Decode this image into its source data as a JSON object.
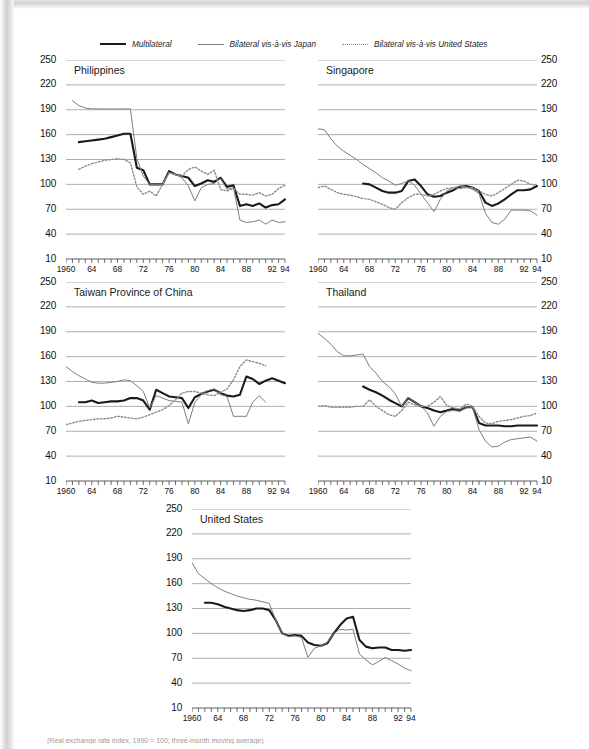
{
  "figure": {
    "footnote": "(Real exchange rate index, 1990 = 100; three-month moving average)"
  },
  "legend": {
    "position": "top",
    "items": [
      {
        "label": "Multilateral",
        "style": "solid-black",
        "color": "#1a1a1a",
        "icon": "line-solid-thick-icon"
      },
      {
        "label": "Bilateral vis-à-vis Japan",
        "style": "solid-gray",
        "color": "#7d7d7d",
        "icon": "line-solid-thin-icon"
      },
      {
        "label": "Bilateral vis-à-vis United States",
        "style": "dotted-gray",
        "color": "#8c8c8c",
        "icon": "line-dotted-icon"
      }
    ]
  },
  "axes": {
    "ylabels": [
      "250",
      "220",
      "190",
      "160",
      "130",
      "100",
      "70",
      "40",
      "10"
    ],
    "yvalues": [
      250,
      220,
      190,
      160,
      130,
      100,
      70,
      40,
      10
    ],
    "ylim": [
      10,
      250
    ],
    "xlabels": [
      "1960",
      "64",
      "68",
      "72",
      "76",
      "80",
      "84",
      "88",
      "92",
      "94"
    ],
    "xvalues": [
      1960,
      1964,
      1968,
      1972,
      1976,
      1980,
      1984,
      1988,
      1992,
      1994
    ],
    "xlim": [
      1960,
      1994
    ],
    "xtick_every": 1,
    "grid": true
  },
  "chart_data": [
    {
      "type": "line",
      "title": "Philippines",
      "xlabel": "",
      "ylabel": "",
      "ylim": [
        10,
        250
      ],
      "xlim": [
        1960,
        1994
      ],
      "grid": true,
      "legend_position": "top",
      "x": [
        1960,
        1961,
        1962,
        1963,
        1964,
        1965,
        1966,
        1967,
        1968,
        1969,
        1970,
        1971,
        1972,
        1973,
        1974,
        1975,
        1976,
        1977,
        1978,
        1979,
        1980,
        1981,
        1982,
        1983,
        1984,
        1985,
        1986,
        1987,
        1988,
        1989,
        1990,
        1991,
        1992,
        1993,
        1994
      ],
      "series": [
        {
          "name": "Multilateral",
          "color": "#1a1a1a",
          "style": "solid-thick",
          "values": [
            null,
            null,
            151,
            152,
            153,
            154,
            155,
            157,
            159,
            161,
            161,
            120,
            117,
            100,
            100,
            100,
            116,
            112,
            110,
            108,
            98,
            101,
            105,
            103,
            108,
            97,
            99,
            74,
            76,
            74,
            77,
            72,
            75,
            76,
            82
          ]
        },
        {
          "name": "Bilateral vis-à-vis Japan",
          "color": "#7d7d7d",
          "style": "solid-thin",
          "values": [
            null,
            201,
            195,
            192,
            191,
            191,
            191,
            191,
            191,
            191,
            191,
            131,
            110,
            100,
            100,
            100,
            114,
            112,
            108,
            98,
            80,
            96,
            100,
            101,
            107,
            94,
            96,
            57,
            54,
            55,
            57,
            52,
            57,
            54,
            55
          ]
        },
        {
          "name": "Bilateral vis-à-vis United States",
          "color": "#8c8c8c",
          "style": "dotted",
          "values": [
            null,
            null,
            118,
            122,
            125,
            127,
            129,
            130,
            131,
            130,
            126,
            97,
            88,
            92,
            86,
            100,
            114,
            112,
            110,
            118,
            121,
            116,
            112,
            117,
            94,
            92,
            95,
            88,
            88,
            87,
            90,
            86,
            88,
            95,
            99
          ]
        }
      ]
    },
    {
      "type": "line",
      "title": "Singapore",
      "xlabel": "",
      "ylabel": "",
      "ylim": [
        10,
        250
      ],
      "xlim": [
        1960,
        1994
      ],
      "grid": true,
      "legend_position": "top",
      "x": [
        1960,
        1961,
        1962,
        1963,
        1964,
        1965,
        1966,
        1967,
        1968,
        1969,
        1970,
        1971,
        1972,
        1973,
        1974,
        1975,
        1976,
        1977,
        1978,
        1979,
        1980,
        1981,
        1982,
        1983,
        1984,
        1985,
        1986,
        1987,
        1988,
        1989,
        1990,
        1991,
        1992,
        1993,
        1994
      ],
      "series": [
        {
          "name": "Multilateral",
          "color": "#1a1a1a",
          "style": "solid-thick",
          "values": [
            null,
            null,
            null,
            null,
            null,
            null,
            null,
            101,
            100,
            96,
            92,
            90,
            90,
            92,
            104,
            106,
            98,
            88,
            85,
            86,
            90,
            93,
            97,
            98,
            96,
            92,
            78,
            74,
            77,
            82,
            88,
            93,
            93,
            94,
            98
          ]
        },
        {
          "name": "Bilateral vis-à-vis Japan",
          "color": "#7d7d7d",
          "style": "solid-thin",
          "values": [
            167,
            166,
            155,
            146,
            140,
            135,
            130,
            124,
            119,
            114,
            108,
            104,
            99,
            101,
            104,
            99,
            88,
            78,
            67,
            82,
            92,
            96,
            98,
            97,
            94,
            89,
            65,
            54,
            52,
            58,
            69,
            69,
            69,
            68,
            63
          ]
        },
        {
          "name": "Bilateral vis-à-vis United States",
          "color": "#8c8c8c",
          "style": "dotted",
          "values": [
            96,
            98,
            94,
            90,
            88,
            87,
            85,
            83,
            82,
            79,
            76,
            72,
            70,
            78,
            84,
            88,
            88,
            86,
            88,
            92,
            95,
            96,
            95,
            96,
            96,
            92,
            88,
            86,
            90,
            95,
            100,
            105,
            104,
            100,
            99
          ]
        }
      ]
    },
    {
      "type": "line",
      "title": "Taiwan Province of China",
      "xlabel": "",
      "ylabel": "",
      "ylim": [
        10,
        250
      ],
      "xlim": [
        1960,
        1994
      ],
      "grid": true,
      "legend_position": "top",
      "x": [
        1960,
        1961,
        1962,
        1963,
        1964,
        1965,
        1966,
        1967,
        1968,
        1969,
        1970,
        1971,
        1972,
        1973,
        1974,
        1975,
        1976,
        1977,
        1978,
        1979,
        1980,
        1981,
        1982,
        1983,
        1984,
        1985,
        1986,
        1987,
        1988,
        1989,
        1990,
        1991,
        1992,
        1993,
        1994
      ],
      "series": [
        {
          "name": "Multilateral",
          "color": "#1a1a1a",
          "style": "solid-thick",
          "values": [
            null,
            null,
            105,
            105,
            107,
            104,
            105,
            106,
            106,
            107,
            110,
            110,
            107,
            96,
            120,
            116,
            112,
            111,
            110,
            98,
            111,
            115,
            118,
            120,
            116,
            113,
            112,
            114,
            136,
            133,
            127,
            131,
            134,
            131,
            128
          ]
        },
        {
          "name": "Bilateral vis-à-vis Japan",
          "color": "#7d7d7d",
          "style": "solid-thin",
          "values": [
            148,
            142,
            137,
            133,
            129,
            128,
            128,
            129,
            130,
            132,
            131,
            125,
            118,
            98,
            113,
            110,
            107,
            106,
            105,
            79,
            105,
            114,
            119,
            121,
            114,
            112,
            88,
            88,
            88,
            105,
            113,
            105,
            null,
            null,
            null
          ]
        },
        {
          "name": "Bilateral vis-à-vis United States",
          "color": "#8c8c8c",
          "style": "dotted",
          "values": [
            78,
            80,
            82,
            83,
            84,
            85,
            85,
            86,
            88,
            87,
            86,
            85,
            87,
            90,
            93,
            96,
            101,
            108,
            116,
            118,
            118,
            116,
            114,
            113,
            117,
            121,
            132,
            148,
            156,
            154,
            152,
            149,
            null,
            null,
            null
          ]
        }
      ]
    },
    {
      "type": "line",
      "title": "Thailand",
      "xlabel": "",
      "ylabel": "",
      "ylim": [
        10,
        250
      ],
      "xlim": [
        1960,
        1994
      ],
      "grid": true,
      "legend_position": "top",
      "x": [
        1960,
        1961,
        1962,
        1963,
        1964,
        1965,
        1966,
        1967,
        1968,
        1969,
        1970,
        1971,
        1972,
        1973,
        1974,
        1975,
        1976,
        1977,
        1978,
        1979,
        1980,
        1981,
        1982,
        1983,
        1984,
        1985,
        1986,
        1987,
        1988,
        1989,
        1990,
        1991,
        1992,
        1993,
        1994
      ],
      "series": [
        {
          "name": "Multilateral",
          "color": "#1a1a1a",
          "style": "solid-thick",
          "values": [
            null,
            null,
            null,
            null,
            null,
            null,
            null,
            124,
            120,
            117,
            113,
            108,
            104,
            100,
            110,
            105,
            100,
            98,
            95,
            93,
            95,
            97,
            95,
            99,
            99,
            80,
            77,
            77,
            77,
            76,
            76,
            77,
            77,
            77,
            77
          ]
        },
        {
          "name": "Bilateral vis-à-vis Japan",
          "color": "#7d7d7d",
          "style": "solid-thin",
          "values": [
            188,
            182,
            175,
            166,
            161,
            161,
            162,
            163,
            148,
            140,
            130,
            124,
            115,
            100,
            110,
            105,
            100,
            92,
            76,
            88,
            94,
            95,
            94,
            99,
            99,
            72,
            58,
            51,
            52,
            57,
            60,
            61,
            62,
            63,
            58
          ]
        },
        {
          "name": "Bilateral vis-à-vis United States",
          "color": "#8c8c8c",
          "style": "dotted",
          "values": [
            100,
            101,
            99,
            99,
            99,
            99,
            100,
            100,
            108,
            100,
            95,
            90,
            88,
            95,
            105,
            102,
            100,
            100,
            105,
            112,
            101,
            98,
            97,
            103,
            100,
            88,
            80,
            79,
            82,
            83,
            84,
            86,
            88,
            89,
            92
          ]
        }
      ]
    },
    {
      "type": "line",
      "title": "United States",
      "xlabel": "",
      "ylabel": "",
      "ylim": [
        10,
        250
      ],
      "xlim": [
        1960,
        1994
      ],
      "grid": true,
      "legend_position": "top",
      "x": [
        1960,
        1961,
        1962,
        1963,
        1964,
        1965,
        1966,
        1967,
        1968,
        1969,
        1970,
        1971,
        1972,
        1973,
        1974,
        1975,
        1976,
        1977,
        1978,
        1979,
        1980,
        1981,
        1982,
        1983,
        1984,
        1985,
        1986,
        1987,
        1988,
        1989,
        1990,
        1991,
        1992,
        1993,
        1994
      ],
      "series": [
        {
          "name": "Multilateral",
          "color": "#1a1a1a",
          "style": "solid-thick",
          "values": [
            null,
            null,
            137,
            137,
            135,
            132,
            130,
            128,
            127,
            128,
            130,
            130,
            128,
            116,
            100,
            97,
            98,
            97,
            89,
            86,
            85,
            88,
            100,
            110,
            118,
            120,
            92,
            84,
            82,
            83,
            83,
            80,
            80,
            79,
            80
          ]
        },
        {
          "name": "Bilateral vis-à-vis Japan",
          "color": "#7d7d7d",
          "style": "solid-thin",
          "values": [
            185,
            172,
            166,
            160,
            155,
            151,
            148,
            145,
            143,
            141,
            140,
            138,
            136,
            116,
            100,
            96,
            97,
            95,
            71,
            82,
            85,
            89,
            100,
            105,
            104,
            105,
            75,
            68,
            62,
            66,
            71,
            67,
            63,
            58,
            55
          ]
        }
      ]
    }
  ],
  "panels": [
    {
      "id": "philippines",
      "title": "Philippines",
      "ylabels_side": "left"
    },
    {
      "id": "singapore",
      "title": "Singapore",
      "ylabels_side": "right"
    },
    {
      "id": "taiwan",
      "title": "Taiwan Province of China",
      "ylabels_side": "left"
    },
    {
      "id": "thailand",
      "title": "Thailand",
      "ylabels_side": "right"
    },
    {
      "id": "united-states",
      "title": "United States",
      "ylabels_side": "left"
    }
  ]
}
